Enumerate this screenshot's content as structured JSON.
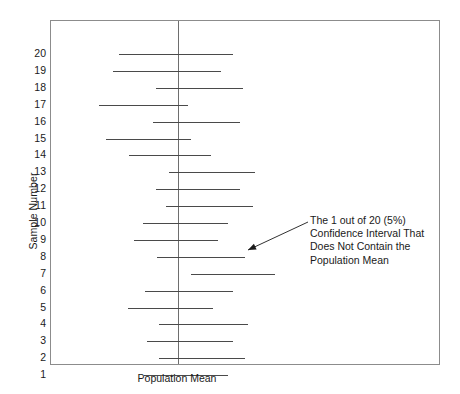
{
  "chart_data": {
    "type": "line",
    "title": "",
    "subtitle": "",
    "xlabel": "Population Mean",
    "ylabel": "Sample Number",
    "grid": false,
    "legend_position": "none",
    "orientation": "horizontal-intervals",
    "reference_line": {
      "name": "population-mean",
      "orientation": "vertical",
      "value": 0,
      "label": "Population Mean",
      "color": "#6e6e6e"
    },
    "xlim": [
      -2.1,
      3.35
    ],
    "ylim": [
      0.5,
      20.5
    ],
    "x_tick_labels": [],
    "y_tick_labels": [
      "20",
      "19",
      "18",
      "17",
      "16",
      "15",
      "14",
      "13",
      "12",
      "11",
      "10",
      "9",
      "8",
      "7",
      "6",
      "5",
      "4",
      "3",
      "2",
      "1"
    ],
    "series_color": "#4a4a4a",
    "intervals": [
      {
        "sample": 20,
        "lower": -0.83,
        "upper": 0.78,
        "contains_mean": true
      },
      {
        "sample": 19,
        "lower": -0.91,
        "upper": 0.6,
        "contains_mean": true
      },
      {
        "sample": 18,
        "lower": -0.31,
        "upper": 0.91,
        "contains_mean": true
      },
      {
        "sample": 17,
        "lower": -1.11,
        "upper": 0.14,
        "contains_mean": true
      },
      {
        "sample": 16,
        "lower": -0.35,
        "upper": 0.88,
        "contains_mean": true
      },
      {
        "sample": 15,
        "lower": -1.01,
        "upper": 0.18,
        "contains_mean": true
      },
      {
        "sample": 14,
        "lower": -0.69,
        "upper": 0.46,
        "contains_mean": true
      },
      {
        "sample": 13,
        "lower": -0.13,
        "upper": 1.09,
        "contains_mean": true
      },
      {
        "sample": 12,
        "lower": -0.31,
        "upper": 0.88,
        "contains_mean": true
      },
      {
        "sample": 11,
        "lower": -0.17,
        "upper": 1.05,
        "contains_mean": true
      },
      {
        "sample": 10,
        "lower": -0.49,
        "upper": 0.71,
        "contains_mean": true
      },
      {
        "sample": 9,
        "lower": -0.62,
        "upper": 0.57,
        "contains_mean": true
      },
      {
        "sample": 8,
        "lower": -0.29,
        "upper": 0.95,
        "contains_mean": true
      },
      {
        "sample": 7,
        "lower": 0.18,
        "upper": 1.37,
        "contains_mean": false
      },
      {
        "sample": 6,
        "lower": -0.46,
        "upper": 0.77,
        "contains_mean": true
      },
      {
        "sample": 5,
        "lower": -0.7,
        "upper": 0.5,
        "contains_mean": true
      },
      {
        "sample": 4,
        "lower": -0.27,
        "upper": 0.99,
        "contains_mean": true
      },
      {
        "sample": 3,
        "lower": -0.43,
        "upper": 0.77,
        "contains_mean": true
      },
      {
        "sample": 2,
        "lower": -0.27,
        "upper": 0.95,
        "contains_mean": true
      },
      {
        "sample": 1,
        "lower": -0.48,
        "upper": 0.71,
        "contains_mean": true
      }
    ],
    "annotations": [
      {
        "name": "outlier-interval-callout",
        "lines": [
          "The 1 out of 20 (5%)",
          "Confidence Interval That",
          "Does Not Contain the",
          "Population Mean"
        ],
        "points_to_sample": 7
      }
    ]
  },
  "axes": {
    "y_title": "Sample Number",
    "x_title": "Population Mean"
  },
  "geometry": {
    "plot_left_px": 50,
    "plot_top_px": 20,
    "plot_width_px": 390,
    "plot_height_px": 345,
    "mean_line_x_px": 127,
    "px_per_unit": 71.0,
    "row_pitch_px": 16.9,
    "first_row_center_px": 33
  },
  "annotation_box": {
    "left_px": 310,
    "top_px": 214
  },
  "arrow": {
    "from_x_px": 308,
    "from_y_px": 222,
    "to_x_px": 248,
    "to_y_px": 250
  }
}
